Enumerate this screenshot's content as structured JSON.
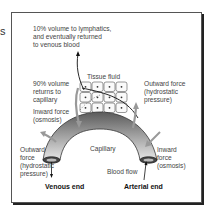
{
  "stray_text": "s",
  "labels": {
    "lymphatics": "10% volume to lymphatics,\nand eventually returned\nto venous blood",
    "tissue_fluid": "Tissue fluid",
    "returns_capillary": "90% volume\nreturns to\ncapillary",
    "outward_force_top": "Outward force\n(hydrostatic\npressure)",
    "inward_force_left": "Inward force\n(osmosis)",
    "outward_force_left": "Outward\nforce\n(hydrostatic\npressure)",
    "capillary": "Capillary",
    "inward_force_right": "Inward\nforce\n(osmosis)",
    "blood_flow": "Blood flow",
    "venous_end": "Venous end",
    "arterial_end": "Arterial end"
  },
  "grid": {
    "rows": 3,
    "cols": 4
  },
  "colors": {
    "tube_dark": "#6e6e6e",
    "tube_light": "#d8d8d8",
    "arrow_gray": "#9a9a9a",
    "line": "#222222"
  }
}
